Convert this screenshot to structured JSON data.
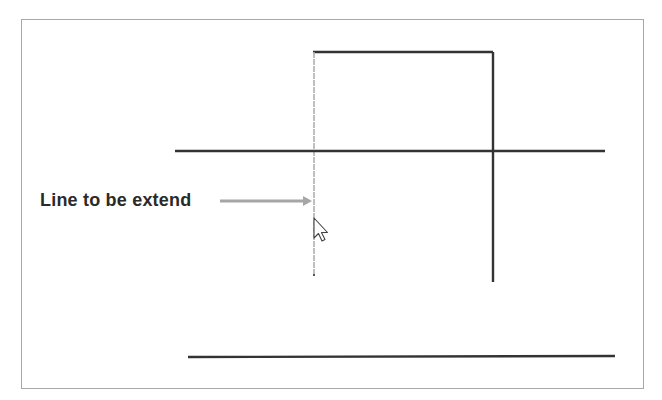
{
  "diagram": {
    "annotation_label": "Line to be extend",
    "colors": {
      "frame": "#a8a8a8",
      "dark_line": "#333333",
      "selected_line": "#b0b0b0",
      "arrow": "#a0a0a0",
      "text": "#2a2a2a"
    },
    "lines": [
      {
        "id": "top-horizontal",
        "x1": 313,
        "y1": 52,
        "x2": 493,
        "y2": 52,
        "style": "dark"
      },
      {
        "id": "left-vertical-to-extend",
        "x1": 314,
        "y1": 52,
        "x2": 314,
        "y2": 276,
        "style": "selected-dashed"
      },
      {
        "id": "right-vertical",
        "x1": 493,
        "y1": 52,
        "x2": 493,
        "y2": 282,
        "style": "dark"
      },
      {
        "id": "middle-horizontal",
        "x1": 175,
        "y1": 151,
        "x2": 605,
        "y2": 151,
        "style": "dark"
      },
      {
        "id": "bottom-horizontal-boundary",
        "x1": 188,
        "y1": 357,
        "x2": 615,
        "y2": 356,
        "style": "dark"
      }
    ],
    "cursor": {
      "type": "arrow-pointer",
      "x": 315,
      "y": 220
    }
  }
}
